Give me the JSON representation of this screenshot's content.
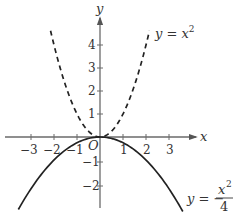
{
  "figure": {
    "axes": {
      "x_label": "x",
      "y_label": "y",
      "origin_label": "O",
      "x_ticks": [
        -3,
        -2,
        -1,
        1,
        2,
        3
      ],
      "y_ticks": [
        4,
        3,
        2,
        1,
        -1,
        -2
      ],
      "x_tick_labels": [
        "−3",
        "−2",
        "−1",
        "1",
        "2",
        "3"
      ],
      "y_tick_labels": [
        "4",
        "3",
        "2",
        "1",
        "−1",
        "−2"
      ]
    },
    "curves": [
      {
        "name": "y = x^2",
        "style": "dashed",
        "label_lhs": "y = x",
        "label_exp": "2",
        "x_range": [
          -2.15,
          2.15
        ]
      },
      {
        "name": "y = -x^2/4",
        "style": "solid",
        "label_lhs": "y = −",
        "label_num": "x",
        "label_num_exp": "2",
        "label_den": "4",
        "x_range": [
          -3.55,
          3.6
        ]
      }
    ],
    "colors": {
      "axis": "#6a6a6a",
      "curve": "#222222",
      "text": "#333333",
      "background": "#ffffff"
    }
  }
}
